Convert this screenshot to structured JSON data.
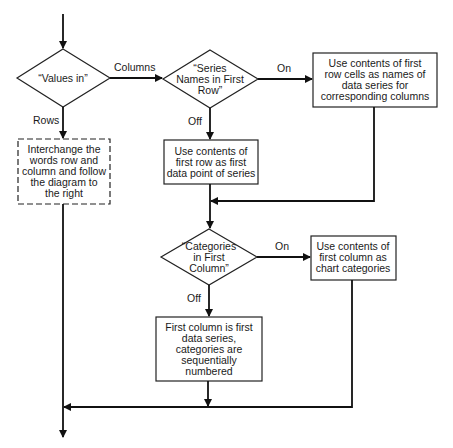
{
  "diagram": {
    "decisions": {
      "values_in": {
        "lines": [
          "“Values in”"
        ]
      },
      "series_names": {
        "lines": [
          "“Series",
          "Names in First",
          "Row”"
        ]
      },
      "categories": {
        "lines": [
          "“Categories",
          "in First",
          "Column”"
        ]
      }
    },
    "processes": {
      "interchange": {
        "lines": [
          "Interchange the",
          "words row and",
          "column and follow",
          "the diagram to",
          "the right"
        ],
        "style": "dashed"
      },
      "use_first_row_names": {
        "lines": [
          "Use contents of first",
          "row cells as names of",
          "data series for",
          "corresponding columns"
        ]
      },
      "use_first_row_data": {
        "lines": [
          "Use contents of",
          "first row as first",
          "data point of series"
        ]
      },
      "use_first_column_categories": {
        "lines": [
          "Use contents of",
          "first column as",
          "chart categories"
        ]
      },
      "first_column_series": {
        "lines": [
          "First column is first",
          "data series,",
          "categories are",
          "sequentially",
          "numbered"
        ]
      }
    },
    "edge_labels": {
      "columns": "Columns",
      "rows": "Rows",
      "series_on": "On",
      "series_off": "Off",
      "categories_on": "On",
      "categories_off": "Off"
    }
  }
}
